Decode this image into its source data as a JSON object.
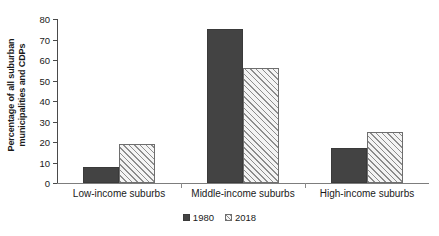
{
  "chart_data": {
    "type": "bar",
    "title": "",
    "xlabel": "",
    "ylabel_line1": "Percentage of all suburban",
    "ylabel_line2": "municipalities and CDPs",
    "categories": [
      "Low-income suburbs",
      "Middle-income suburbs",
      "High-income suburbs"
    ],
    "series": [
      {
        "name": "1980",
        "values": [
          8,
          75,
          17
        ],
        "style": "solid",
        "color": "#434343"
      },
      {
        "name": "2018",
        "values": [
          19,
          56,
          25
        ],
        "style": "hatched",
        "color": "#f2f2f2"
      }
    ],
    "ylim": [
      0,
      80
    ],
    "ytick_step": 10,
    "yticks": [
      0,
      10,
      20,
      30,
      40,
      50,
      60,
      70,
      80
    ],
    "ytick_labels": [
      "0",
      "10",
      "20",
      "30",
      "40",
      "50",
      "60",
      "70",
      "80"
    ],
    "grid": false,
    "legend_position": "bottom-center",
    "legend_entries": [
      "1980",
      "2018"
    ]
  },
  "colors": {
    "series_1980": "#434343",
    "series_2018_fill": "#f2f2f2",
    "series_2018_hatch": "#8d8d8d",
    "axis": "#4a4a4a",
    "text": "#1a1a1a",
    "background": "#ffffff"
  }
}
